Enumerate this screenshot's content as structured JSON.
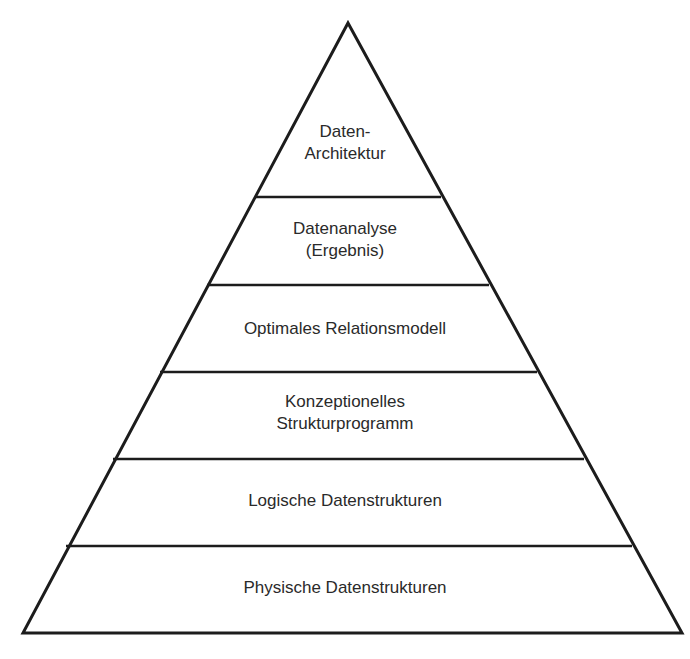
{
  "diagram": {
    "type": "pyramid",
    "levels": [
      {
        "line1": "Daten-",
        "line2": "Architektur"
      },
      {
        "line1": "Datenanalyse",
        "line2": "(Ergebnis)"
      },
      {
        "line1": "Optimales Relationsmodell"
      },
      {
        "line1": "Konzeptionelles",
        "line2": "Strukturprogramm"
      },
      {
        "line1": "Logische Datenstrukturen"
      },
      {
        "line1": "Physische Datenstrukturen"
      }
    ]
  }
}
